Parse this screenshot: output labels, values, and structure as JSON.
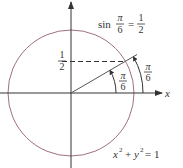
{
  "title_equation": {
    "func": "sin",
    "arg_num": "π",
    "arg_den": "6",
    "equals": "=",
    "val_num": "1",
    "val_den": "2"
  },
  "y_label": {
    "num": "1",
    "den": "2"
  },
  "inner_angle": {
    "num": "π",
    "den": "6"
  },
  "outer_angle": {
    "num": "π",
    "den": "6"
  },
  "x_axis_label": "x",
  "circle_equation": {
    "x": "x",
    "y": "y",
    "exp": "2",
    "plus": "+",
    "eq": "= 1"
  },
  "angle_degrees": 30,
  "colors": {
    "circle": "#a07080",
    "line": "#444444",
    "axis": "#333333"
  }
}
